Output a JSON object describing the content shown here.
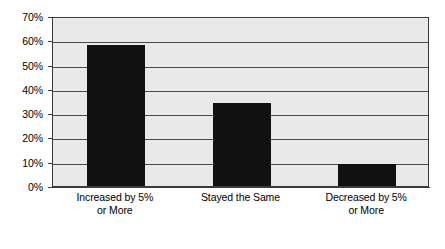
{
  "chart_data": {
    "type": "bar",
    "title": "",
    "subtitle": "",
    "xlabel": "",
    "ylabel": "",
    "categories": [
      "Increased by 5% or More",
      "Stayed the Same",
      "Decreased by 5% or More"
    ],
    "category_lines": [
      [
        "Increased by 5%",
        "or More"
      ],
      [
        "Stayed the Same"
      ],
      [
        "Decreased by 5%",
        "or More"
      ]
    ],
    "values": [
      58,
      34,
      9
    ],
    "value_labels": [
      "58%",
      "34%",
      "9%"
    ],
    "ylim": [
      0,
      70
    ],
    "ytick_values": [
      70,
      60,
      50,
      40,
      30,
      20,
      10,
      0
    ],
    "ytick_labels": [
      "70%",
      "60%",
      "50%",
      "40%",
      "30%",
      "20%",
      "10%",
      "0%"
    ],
    "grid": true,
    "grid_axis": "y",
    "legend": false,
    "legend_position": "none",
    "colors": {
      "bar_fill": "#111111",
      "plot_background": "#e9e9e9",
      "figure_background": "#ffffff",
      "gridline": "#4a4a4a",
      "axis_line": "#3a3a3a",
      "text": "#000000"
    }
  }
}
